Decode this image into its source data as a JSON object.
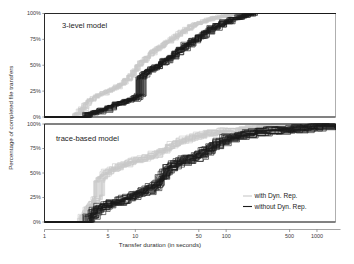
{
  "chart_data": {
    "type": "line",
    "title": "",
    "xlabel": "Transfer duration (in seconds)",
    "ylabel": "Percentage of completed file transfers",
    "xscale": "log",
    "xlim": [
      1,
      1600
    ],
    "ylim": [
      0,
      100
    ],
    "xticks": [
      1,
      5,
      10,
      50,
      100,
      500,
      1000
    ],
    "xticklabels": [
      "1",
      "5",
      "10",
      "50",
      "100",
      "500",
      "1000"
    ],
    "yticks": [
      0,
      25,
      50,
      75,
      100
    ],
    "yticklabels": [
      "0%",
      "25%",
      "50%",
      "75%",
      "100%"
    ],
    "grid": false,
    "legend_position": "lower right",
    "legend": [
      {
        "label": "with Dyn. Rep.",
        "color": "#c9c9c9"
      },
      {
        "label": "without Dyn. Rep.",
        "color": "#1b1b1b"
      }
    ],
    "panels": [
      {
        "id": "top",
        "label": "3-level model",
        "series": [
          {
            "name": "with Dyn. Rep.",
            "color": "#c9c9c9",
            "n_runs": 20,
            "spread_x": 0.035,
            "spread_y": 1.2,
            "x": [
              1.0,
              2.1,
              2.2,
              2.5,
              2.8,
              3.0,
              3.4,
              3.8,
              4.2,
              4.8,
              5.4,
              6.0,
              6.8,
              7.6,
              8.5,
              9.5,
              10.5,
              11.5,
              13.0,
              14.5,
              16.0,
              18.0,
              20.0,
              22.0,
              25.0,
              28.0,
              31.0,
              35.0,
              40.0,
              45.0,
              52.0,
              60.0,
              70.0,
              82.0,
              95.0,
              110.0,
              130.0,
              160.0,
              200.0,
              1600.0
            ],
            "y": [
              0,
              0,
              3,
              8,
              13,
              16,
              19,
              21,
              23,
              25,
              27,
              29,
              32,
              36,
              40,
              45,
              50,
              54,
              58,
              62,
              65,
              68,
              71,
              73,
              76,
              79,
              82,
              85,
              88,
              90,
              92,
              94,
              96,
              97,
              98,
              99,
              99.5,
              100,
              100,
              100
            ]
          },
          {
            "name": "without Dyn. Rep.",
            "color": "#1b1b1b",
            "n_runs": 24,
            "spread_x": 0.045,
            "spread_y": 1.6,
            "x": [
              1.0,
              2.9,
              3.0,
              3.6,
              4.2,
              5.0,
              5.6,
              6.2,
              7.0,
              8.0,
              9.0,
              10.0,
              11.0,
              11.6,
              12.2,
              13.0,
              14.0,
              15.5,
              17.0,
              19.0,
              21.0,
              24.0,
              27.0,
              31.0,
              36.0,
              42.0,
              50.0,
              58.0,
              68.0,
              80.0,
              95.0,
              115.0,
              140.0,
              170.0,
              200.0,
              240.0,
              1600.0
            ],
            "y": [
              0,
              0,
              3,
              5,
              7,
              9,
              11,
              13,
              14,
              16,
              17,
              19,
              21,
              38,
              41,
              43,
              45,
              47,
              49,
              52,
              55,
              58,
              62,
              66,
              70,
              74,
              78,
              82,
              86,
              89,
              92,
              95,
              97,
              99,
              100,
              100,
              100
            ]
          }
        ]
      },
      {
        "id": "bottom",
        "label": "trace-based model",
        "series": [
          {
            "name": "with Dyn. Rep.",
            "color": "#c9c9c9",
            "n_runs": 22,
            "spread_x": 0.05,
            "spread_y": 2.6,
            "x": [
              1.0,
              2.4,
              2.6,
              2.9,
              3.2,
              3.5,
              3.8,
              4.0,
              4.3,
              4.6,
              5.0,
              5.6,
              6.3,
              7.0,
              8.0,
              9.0,
              10.0,
              11.5,
              13.0,
              15.0,
              17.0,
              19.5,
              22.0,
              25.0,
              29.0,
              34.0,
              40.0,
              47.0,
              56.0,
              68.0,
              82.0,
              100.0,
              130.0,
              170.0,
              230.0,
              330.0,
              480.0,
              700.0,
              950.0,
              1600.0
            ],
            "y": [
              0,
              0,
              6,
              12,
              18,
              22,
              25,
              43,
              47,
              50,
              52,
              54,
              56,
              58,
              60,
              62,
              63,
              64,
              66,
              68,
              70,
              73,
              76,
              79,
              82,
              84,
              86,
              88,
              90,
              91,
              92,
              93,
              94,
              95,
              96,
              97,
              98,
              99,
              100,
              100
            ]
          },
          {
            "name": "without Dyn. Rep.",
            "color": "#1b1b1b",
            "n_runs": 28,
            "spread_x": 0.055,
            "spread_y": 3.0,
            "x": [
              1.0,
              2.9,
              3.1,
              3.5,
              4.0,
              4.6,
              5.2,
              6.0,
              7.0,
              8.0,
              9.0,
              10.0,
              11.5,
              13.0,
              15.0,
              17.0,
              19.0,
              21.0,
              23.0,
              26.0,
              30.0,
              35.0,
              41.0,
              48.0,
              57.0,
              68.0,
              82.0,
              100.0,
              125.0,
              160.0,
              210.0,
              280.0,
              380.0,
              520.0,
              700.0,
              900.0,
              1100.0,
              1600.0
            ],
            "y": [
              0,
              0,
              7,
              12,
              15,
              17,
              19,
              21,
              23,
              25,
              27,
              29,
              31,
              33,
              36,
              40,
              46,
              52,
              56,
              59,
              62,
              64,
              66,
              69,
              73,
              78,
              82,
              86,
              88,
              90,
              92,
              93,
              94,
              95,
              96,
              97,
              98,
              98
            ]
          }
        ]
      }
    ]
  },
  "axes": {
    "xlabel": "Transfer duration (in seconds)",
    "ylabel": "Percentage of completed file transfers",
    "xticklabels": [
      "1",
      "5",
      "10",
      "50",
      "100",
      "500",
      "1000"
    ],
    "yticklabels_top": [
      "0%",
      "25%",
      "50%",
      "75%",
      "100%"
    ],
    "yticklabels_bottom": [
      "0%",
      "25%",
      "50%",
      "75%",
      "100%"
    ]
  },
  "panel_labels": {
    "top": "3-level model",
    "bottom": "trace-based model"
  },
  "legend": {
    "items": [
      {
        "label": "with Dyn. Rep.",
        "color": "#c9c9c9"
      },
      {
        "label": "without Dyn. Rep.",
        "color": "#1b1b1b"
      }
    ]
  },
  "colors": {
    "with_dyn_rep": "#c9c9c9",
    "without_dyn_rep": "#1b1b1b",
    "frame": "#8d8d8d",
    "axis": "#1a1a1a",
    "background": "#ffffff"
  }
}
